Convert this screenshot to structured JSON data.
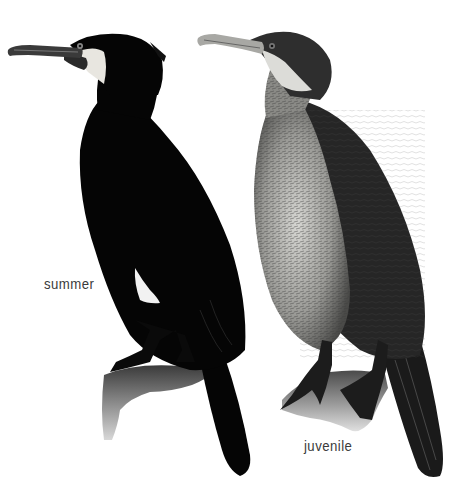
{
  "figure": {
    "birds": [
      {
        "id": "summer",
        "label": "summer",
        "plumage_color": "#050505",
        "cheek_patch_color": "#e8e6e0",
        "thigh_patch_color": "#f2f2f2"
      },
      {
        "id": "juvenile",
        "label": "juvenile",
        "back_color": "#2a2a2a",
        "breast_color": "#b8b8b4",
        "throat_color": "#dcdcd8"
      }
    ],
    "perch_color": "#8a8a8a",
    "background": "#ffffff"
  }
}
